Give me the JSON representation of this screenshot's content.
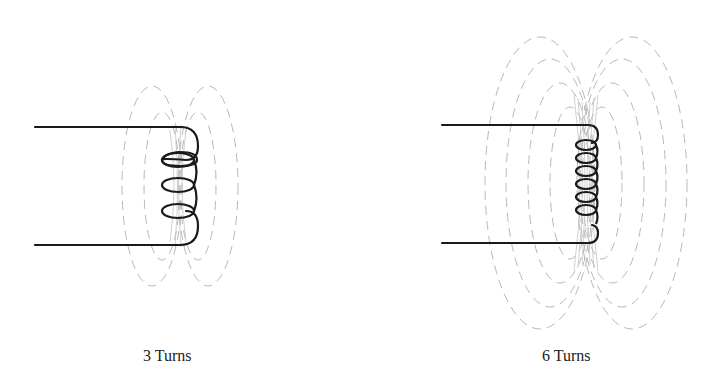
{
  "diagram": {
    "title": "",
    "panels": [
      {
        "id": "left",
        "label": "3 Turns",
        "turns": 3
      },
      {
        "id": "right",
        "label": "6 Turns",
        "turns": 6
      }
    ]
  },
  "colors": {
    "wire": "#1a1a1a",
    "field_lines": "#b8b8b8",
    "background": "#ffffff",
    "text": "#222222"
  }
}
